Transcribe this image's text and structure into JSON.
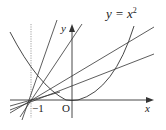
{
  "diagram": {
    "type": "math-graph",
    "curve_label": "y = x",
    "curve_exponent": "2",
    "axis_x_label": "x",
    "axis_y_label": "y",
    "origin_label": "O",
    "tick_label_neg1": "−1",
    "elements": [
      {
        "kind": "axis",
        "name": "x-axis"
      },
      {
        "kind": "axis",
        "name": "y-axis"
      },
      {
        "kind": "curve",
        "name": "parabola",
        "equation": "y = x^2"
      },
      {
        "kind": "dotted-line",
        "name": "vertical line x = -1"
      },
      {
        "kind": "line-family",
        "name": "lines through (-1, 0)",
        "count": 5
      }
    ],
    "colors": {
      "stroke": "#333333",
      "dotted": "#888888",
      "text": "#222222"
    }
  }
}
